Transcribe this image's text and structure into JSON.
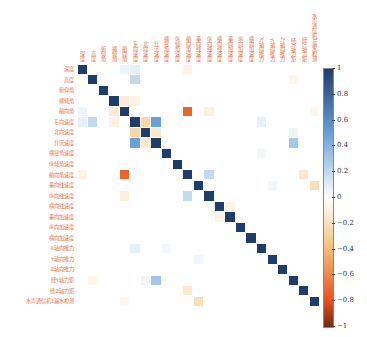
{
  "chart_data": {
    "type": "heatmap",
    "title": "",
    "labels": [
      "深度",
      "高度",
      "俯仰角",
      "横倾角",
      "艏向角",
      "东向速度",
      "北向速度",
      "升沉速度",
      "横摇角速度",
      "纵倾角速度",
      "艏向角速度",
      "垂向线速度",
      "纵向线速度",
      "横向线速度",
      "垂向加速度",
      "纵向加速度",
      "横向加速度",
      "X轴向推力",
      "Y轴向推力",
      "Z轴向推力",
      "绕Y轴力矩",
      "绕Z轴力矩",
      "水声通信机1漏水检测"
    ],
    "colorbar": {
      "min": -1,
      "max": 1,
      "ticks": [
        "1",
        "0.8",
        "0.6",
        "0.4",
        "0.2",
        "0",
        "−0.2",
        "−0.4",
        "−0.6",
        "−0.8",
        "−1"
      ]
    },
    "colormap": {
      "pos": "#1f3d6b",
      "pos_mid": "#6aa0d8",
      "neutral": "#ffffff",
      "neg_mid": "#f5c98a",
      "neg": "#e8501e",
      "neg_end": "#6b2b12"
    },
    "diagonal": 1.0,
    "offdiag": [
      [
        0,
        5,
        0.08
      ],
      [
        1,
        5,
        0.2
      ],
      [
        3,
        5,
        -0.08
      ],
      [
        0,
        4,
        0.06
      ],
      [
        3,
        4,
        -0.12
      ],
      [
        5,
        6,
        -0.25
      ],
      [
        5,
        7,
        0.5
      ],
      [
        6,
        7,
        -0.15
      ],
      [
        4,
        10,
        -0.72
      ],
      [
        4,
        12,
        -0.1
      ],
      [
        0,
        10,
        -0.08
      ],
      [
        10,
        12,
        0.2
      ],
      [
        10,
        21,
        -0.15
      ],
      [
        7,
        20,
        0.3
      ],
      [
        13,
        14,
        -0.08
      ],
      [
        5,
        17,
        0.08
      ],
      [
        8,
        17,
        0.04
      ],
      [
        6,
        20,
        0.06
      ],
      [
        1,
        20,
        -0.06
      ],
      [
        11,
        18,
        0.05
      ],
      [
        11,
        22,
        -0.2
      ],
      [
        4,
        22,
        -0.05
      ]
    ]
  }
}
